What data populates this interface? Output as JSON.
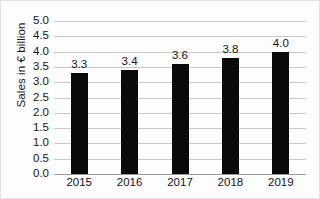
{
  "chart_data": {
    "type": "bar",
    "title": "",
    "xlabel": "",
    "ylabel": "Sales in € billion",
    "categories": [
      "2015",
      "2016",
      "2017",
      "2018",
      "2019"
    ],
    "values": [
      3.3,
      3.4,
      3.6,
      3.8,
      4.0
    ],
    "data_labels": [
      "3.3",
      "3.4",
      "3.6",
      "3.8",
      "4.0"
    ],
    "ylim": [
      0.0,
      5.0
    ],
    "ytick_step": 0.5,
    "ytick_labels": [
      "5.0",
      "4.5",
      "4.0",
      "3.5",
      "3.0",
      "2.5",
      "2.0",
      "1.5",
      "1.0",
      "0.5",
      "0.0"
    ],
    "ytick_values": [
      5.0,
      4.5,
      4.0,
      3.5,
      3.0,
      2.5,
      2.0,
      1.5,
      1.0,
      0.5,
      0.0
    ],
    "grid": true,
    "grid_axis": "y",
    "legend": false,
    "legend_position": "none",
    "series": [
      {
        "name": "Sales",
        "color": "#0a0a0a",
        "values": [
          3.3,
          3.4,
          3.6,
          3.8,
          4.0
        ]
      }
    ],
    "colors": {
      "bar": "#0a0a0a",
      "grid": "#c8c8c8",
      "axis": "#9a9a9a",
      "text": "#141414",
      "background": "#fdfdfd"
    }
  }
}
